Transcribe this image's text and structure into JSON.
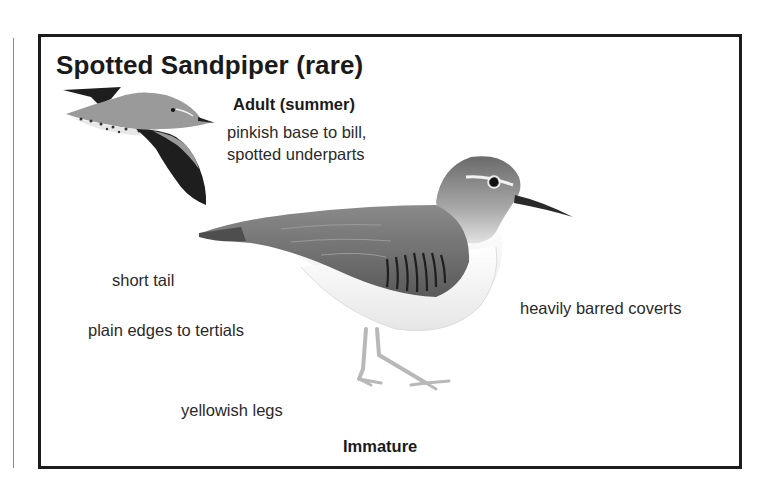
{
  "title": "Spotted Sandpiper (rare)",
  "sections": {
    "adult": {
      "heading": "Adult (summer)",
      "notes": [
        "pinkish base to bill,",
        "spotted underparts"
      ]
    },
    "immature": {
      "heading": "Immature",
      "notes": [
        "short tail",
        "plain edges to tertials",
        "yellowish legs",
        "heavily barred coverts"
      ]
    }
  },
  "illustrations": {
    "flying": "flying-adult-bird-illustration",
    "standing": "standing-immature-bird-illustration"
  },
  "colors": {
    "frame": "#1c1c1c",
    "text": "#1a1a1a",
    "bird_back": "#6e6e6e",
    "bird_belly": "#f4f4f4",
    "wing_dark": "#1e1e1e"
  }
}
